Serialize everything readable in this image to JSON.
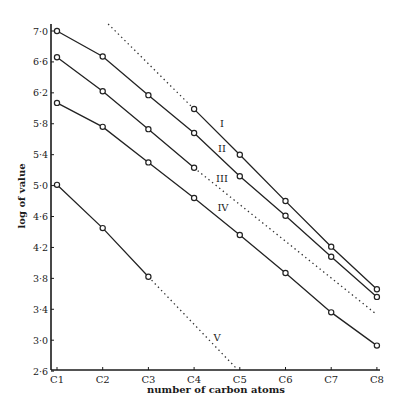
{
  "chart_data": {
    "type": "line",
    "title": "",
    "xlabel": "number of carbon atoms",
    "ylabel": "log of value",
    "categories": [
      "C1",
      "C2",
      "C3",
      "C4",
      "C5",
      "C6",
      "C7",
      "C8"
    ],
    "yticks": [
      "7·0",
      "6·6",
      "6·2",
      "5·8",
      "5·4",
      "5·0",
      "4·6",
      "4·2",
      "3·8",
      "3·4",
      "3·0",
      "2·6"
    ],
    "ytick_values": [
      7.0,
      6.6,
      6.2,
      5.8,
      5.4,
      5.0,
      4.6,
      4.2,
      3.8,
      3.4,
      3.0,
      2.6
    ],
    "ylim": [
      2.6,
      7.0
    ],
    "grid": false,
    "legend": "inline roman-numeral labels",
    "series": [
      {
        "name": "I",
        "x": [
          4,
          5,
          6,
          7,
          8
        ],
        "values": [
          5.99,
          5.4,
          4.8,
          4.21,
          3.66
        ],
        "extrapolation": {
          "style": "dotted",
          "from": [
            4,
            5.99
          ],
          "to": [
            2.07,
            7.12
          ]
        },
        "label_pos": [
          222,
          127
        ]
      },
      {
        "name": "II",
        "x": [
          1,
          2,
          3,
          4,
          5,
          6,
          7,
          8
        ],
        "values": [
          7.0,
          6.67,
          6.17,
          5.68,
          5.12,
          4.61,
          4.08,
          3.56
        ],
        "label_pos": [
          222,
          152
        ]
      },
      {
        "name": "III",
        "x": [
          1,
          2,
          3,
          4
        ],
        "values": [
          6.66,
          6.22,
          5.73,
          5.23
        ],
        "extrapolation": {
          "style": "dotted",
          "from": [
            4,
            5.23
          ],
          "to": [
            8,
            3.33
          ]
        },
        "label_pos": [
          222,
          182
        ]
      },
      {
        "name": "IV",
        "x": [
          1,
          2,
          3,
          4,
          5,
          6,
          7,
          8
        ],
        "values": [
          6.07,
          5.76,
          5.3,
          4.84,
          4.36,
          3.87,
          3.36,
          2.93
        ],
        "label_pos": [
          223,
          211
        ]
      },
      {
        "name": "V",
        "x": [
          1,
          2,
          3
        ],
        "values": [
          5.01,
          4.45,
          3.82
        ],
        "extrapolation": {
          "style": "dotted",
          "from": [
            3,
            3.82
          ],
          "to": [
            4.95,
            2.62
          ]
        },
        "label_pos": [
          217,
          341
        ]
      }
    ]
  }
}
